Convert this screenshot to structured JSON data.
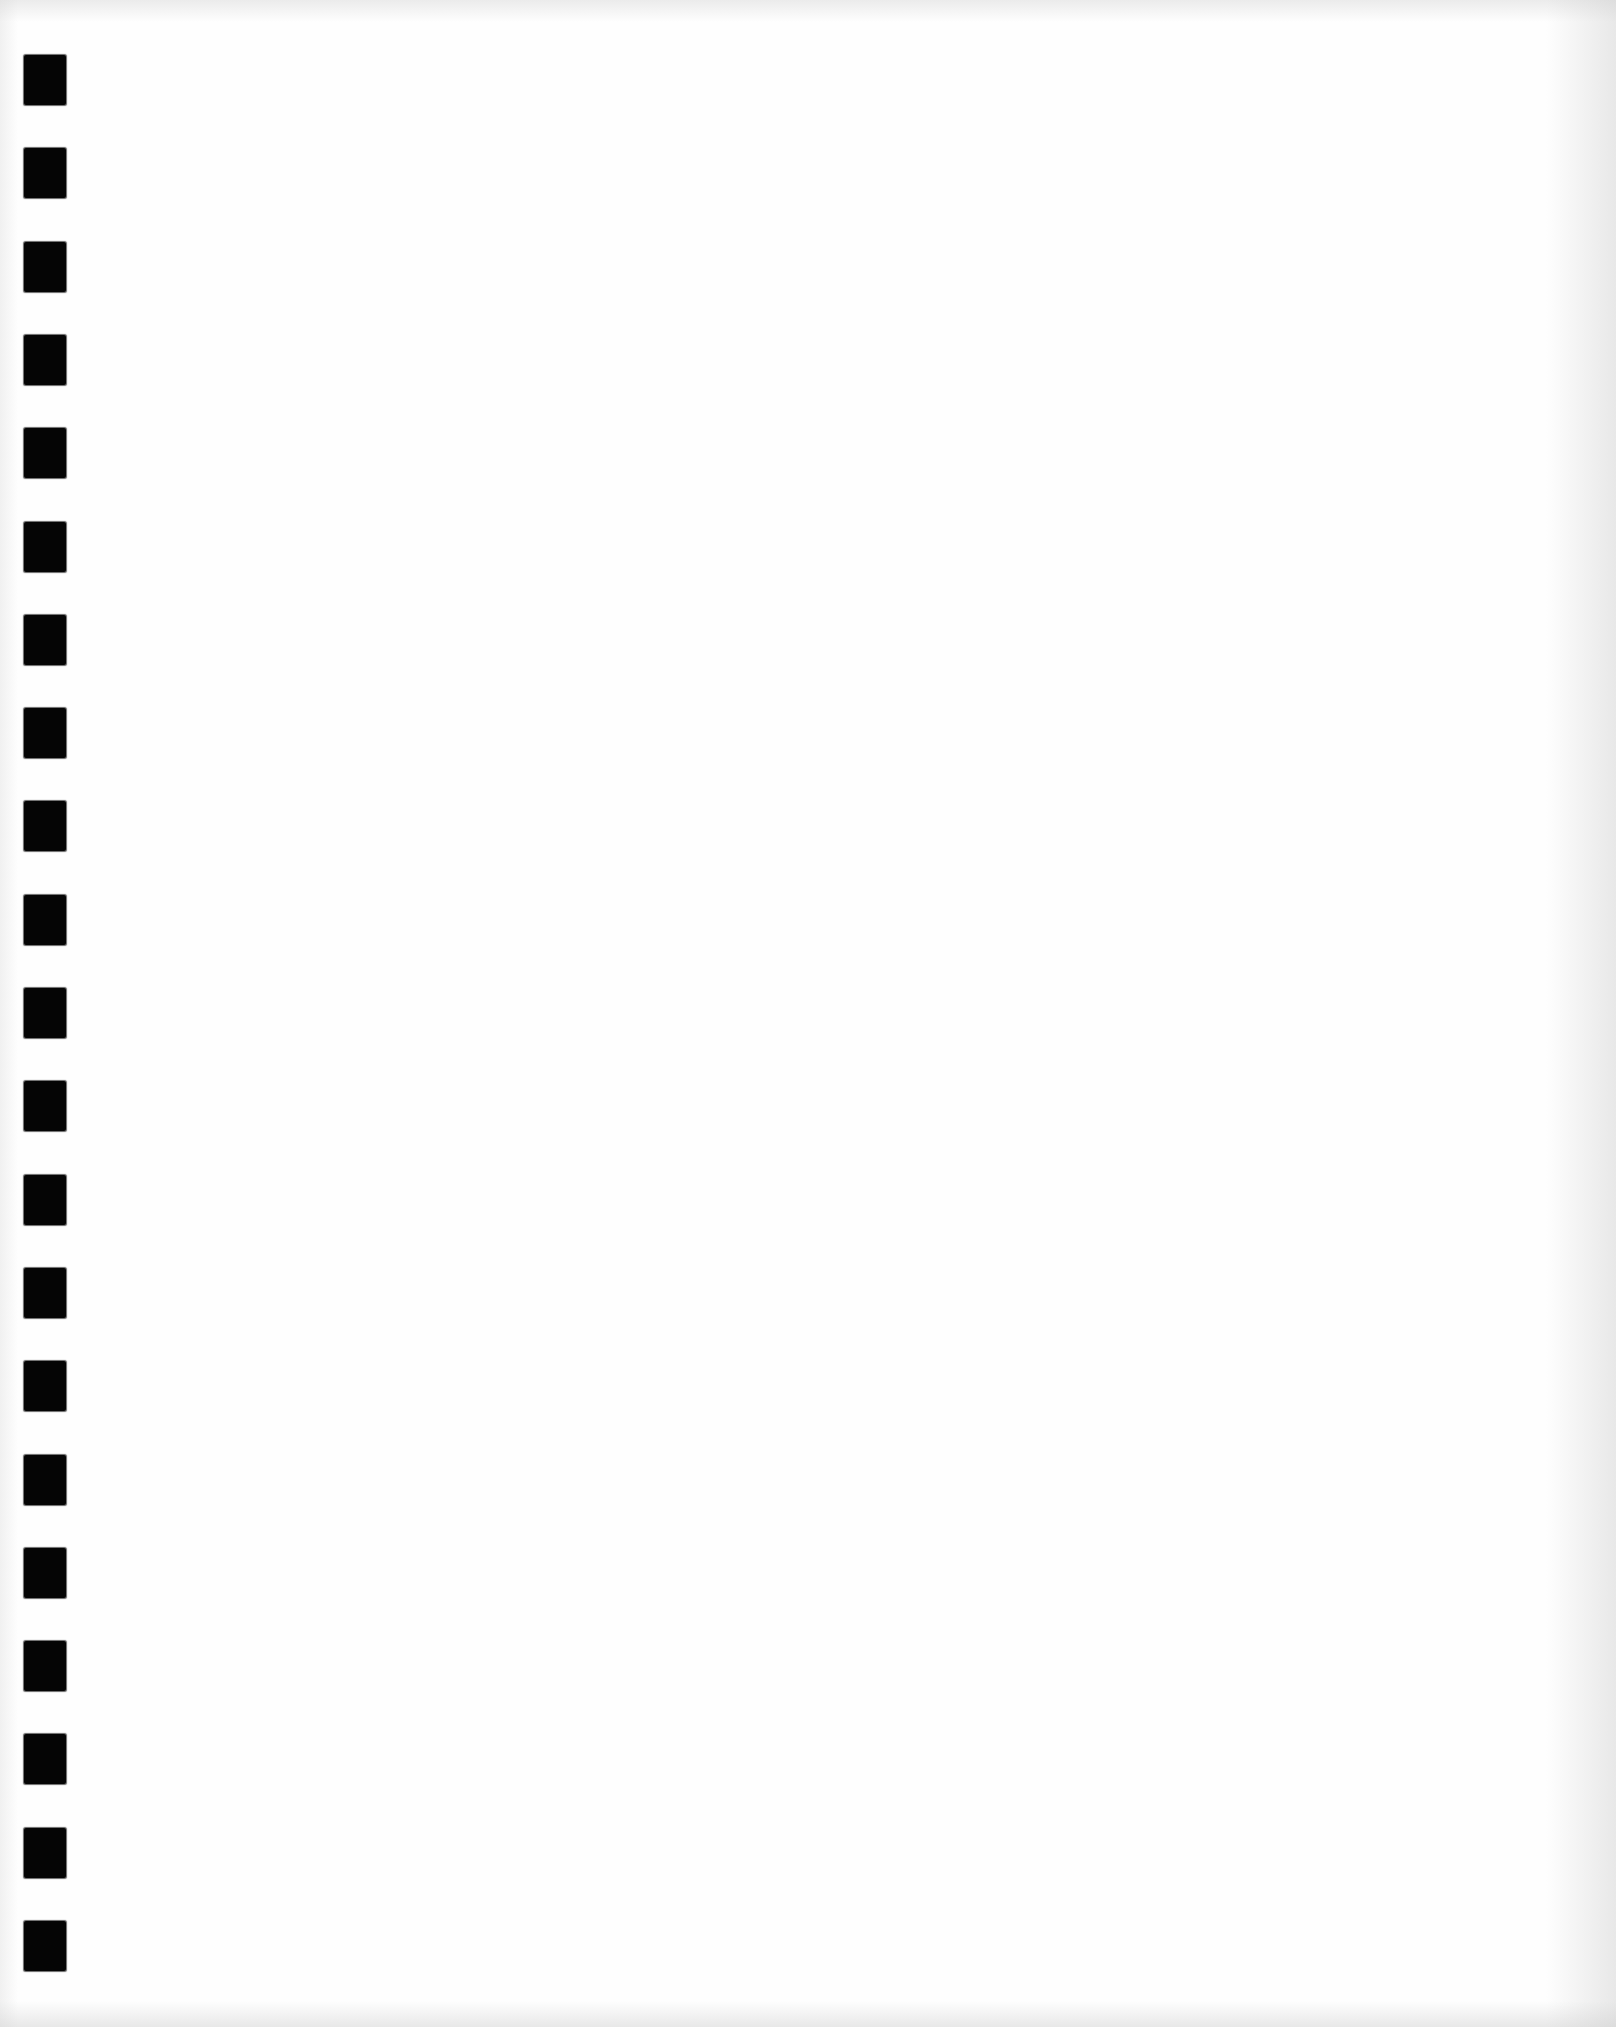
{
  "page": {
    "width": 1616,
    "height": 2027,
    "paper_color": "#fefefe",
    "edge_shade_color": "#cdcdcd"
  },
  "binding_holes": {
    "count": 21,
    "color": "#050505",
    "left": 24,
    "width": 42,
    "height": 50,
    "first_top": 55,
    "pitch": 93.3
  }
}
